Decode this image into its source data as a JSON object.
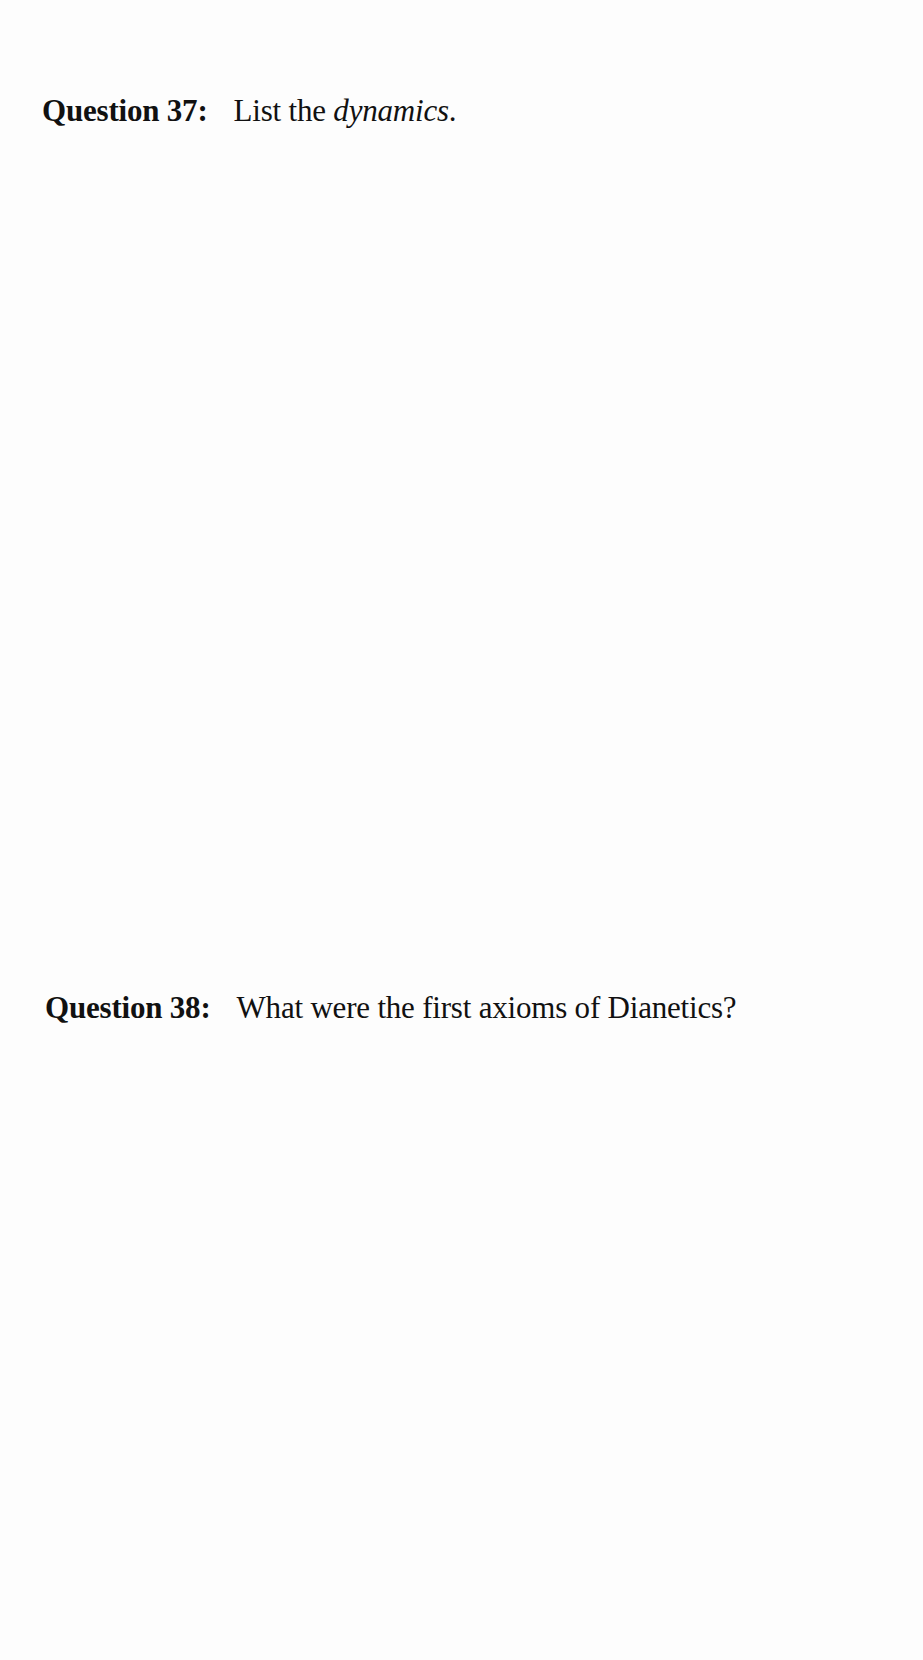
{
  "questions": [
    {
      "label": "Question 37:",
      "text_before": "List the ",
      "text_italic": "dynamics",
      "text_after": "."
    },
    {
      "label": "Question 38:",
      "text": "What were the first axioms of Dianetics?"
    }
  ]
}
